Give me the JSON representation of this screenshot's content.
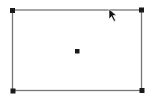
{
  "canvas": {
    "background": "#ffffff",
    "stroke_color": "#777777",
    "handle_color": "#1a1a1a",
    "cursor_color": "#111111"
  },
  "shape": {
    "type": "rectangle",
    "state": "selected",
    "handles": [
      "top-left",
      "top-right",
      "bottom-left",
      "bottom-right",
      "center"
    ]
  },
  "cursor": {
    "icon": "arrow-pointer-icon"
  }
}
